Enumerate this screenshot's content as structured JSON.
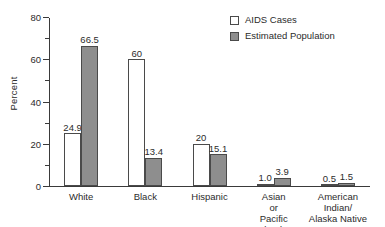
{
  "chart_data": {
    "type": "bar",
    "title": "",
    "xlabel": "",
    "ylabel": "Percent",
    "ylim": [
      0,
      80
    ],
    "ytick_major": [
      0,
      20,
      40,
      60,
      80
    ],
    "ytick_minor": [
      10,
      30,
      50,
      70
    ],
    "grid": false,
    "legend_position": "top-right",
    "categories": [
      "White",
      "Black",
      "Hispanic",
      "Asian\nor\nPacific Islander",
      "American Indian/\nAlaska Native"
    ],
    "series": [
      {
        "name": "AIDS Cases",
        "color": "#ffffff",
        "values": [
          24.9,
          60,
          20,
          1.0,
          0.5
        ],
        "labels": [
          "24.9",
          "60",
          "20",
          "1.0",
          "0.5"
        ]
      },
      {
        "name": "Estimated Population",
        "color": "#8e8e8e",
        "values": [
          66.5,
          13.4,
          15.1,
          3.9,
          1.5
        ],
        "labels": [
          "66.5",
          "13.4",
          "15.1",
          "3.9",
          "1.5"
        ]
      }
    ]
  },
  "axis": {
    "y_label": "Percent",
    "y_ticks": [
      "80",
      "60",
      "40",
      "20",
      "0"
    ]
  },
  "legend": {
    "items": [
      {
        "label": "AIDS Cases"
      },
      {
        "label": "Estimated Population"
      }
    ]
  },
  "colors": {
    "bar_cases": "#ffffff",
    "bar_population": "#8e8e8e",
    "axis": "#3a3a3a",
    "text": "#2b2b2b"
  }
}
